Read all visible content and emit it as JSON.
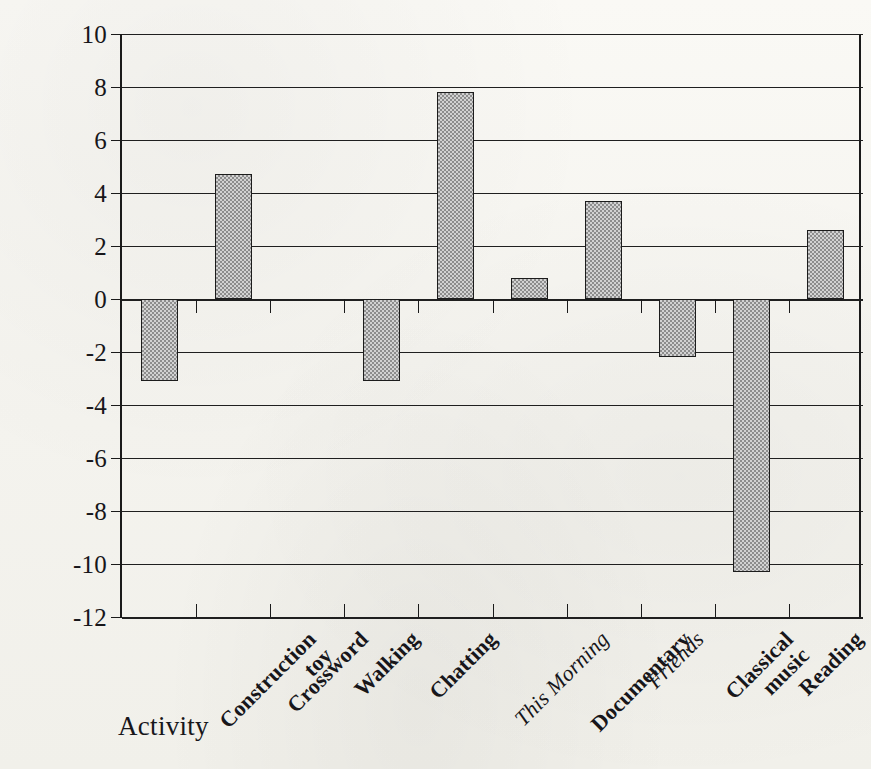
{
  "chart_data": {
    "type": "bar",
    "title": "",
    "xlabel": "Activity",
    "ylabel": "Change in IQ Score",
    "ylim": [
      -12,
      10
    ],
    "ytick_step": 2,
    "yticks": [
      10,
      8,
      6,
      4,
      2,
      0,
      -2,
      -4,
      -6,
      -8,
      -10,
      -12
    ],
    "ytick_labels": [
      "10",
      "8",
      "6",
      "4",
      "2",
      "0",
      "-2",
      "-4",
      "-6",
      "-8",
      "-10",
      "-12"
    ],
    "grid": "horizontal",
    "legend": "none",
    "bar_fill": "#a9a9a9",
    "bar_edge": "#1c1c1c",
    "categories": [
      "Construction toy",
      "Crossword",
      "Walking",
      "Chatting",
      "This Morning",
      "Documentary",
      "Friends",
      "Classical music",
      "Reading",
      "Meditation"
    ],
    "category_labels": [
      {
        "line1": "Construction",
        "line2": "toy",
        "italic": false
      },
      {
        "line1": "Crossword",
        "line2": "",
        "italic": false
      },
      {
        "line1": "Walking",
        "line2": "",
        "italic": false
      },
      {
        "line1": "Chatting",
        "line2": "",
        "italic": false
      },
      {
        "line1": "This Morning",
        "line2": "",
        "italic": true
      },
      {
        "line1": "Documentary",
        "line2": "",
        "italic": false
      },
      {
        "line1": "Friends",
        "line2": "",
        "italic": true
      },
      {
        "line1": "Classical",
        "line2": "music",
        "italic": false
      },
      {
        "line1": "Reading",
        "line2": "",
        "italic": false
      },
      {
        "line1": "Meditation",
        "line2": "",
        "italic": false
      }
    ],
    "values": [
      -3.1,
      4.7,
      0.0,
      -3.1,
      7.8,
      0.8,
      3.7,
      -2.2,
      -10.3,
      2.6
    ]
  },
  "colors": {
    "ink": "#1a1a1a",
    "bar_fill": "#a9a9a9",
    "paper": "#f7f6f2"
  }
}
